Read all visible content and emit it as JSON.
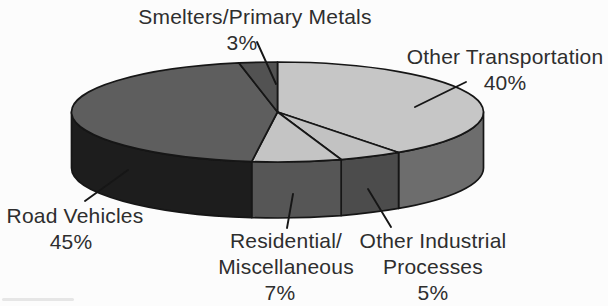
{
  "chart_data": {
    "type": "pie",
    "style": "3d-grayscale",
    "title": "",
    "start_position": "12-o-clock",
    "direction": "clockwise",
    "legend_position": "none",
    "categories": [
      "Other Transportation",
      "Other Industrial Processes",
      "Residential/Miscellaneous",
      "Road Vehicles",
      "Smelters/Primary Metals"
    ],
    "values": [
      40,
      5,
      7,
      45,
      3
    ],
    "slices": [
      {
        "id": "other-transportation",
        "name": "Other Transportation",
        "value": 40,
        "label_lines": [
          "Other Transportation"
        ],
        "pct_label": "40%",
        "top_color": "#c6c6c6",
        "side_color": "#6d6d6d"
      },
      {
        "id": "other-industrial-processes",
        "name": "Other Industrial Processes",
        "value": 5,
        "label_lines": [
          "Other Industrial",
          "Processes"
        ],
        "pct_label": "5%",
        "top_color": "#c2c2c2",
        "side_color": "#4c4c4c"
      },
      {
        "id": "residential-miscellaneous",
        "name": "Residential/Miscellaneous",
        "value": 7,
        "label_lines": [
          "Residential/",
          "Miscellaneous"
        ],
        "pct_label": "7%",
        "top_color": "#c4c4c4",
        "side_color": "#565656"
      },
      {
        "id": "road-vehicles",
        "name": "Road Vehicles",
        "value": 45,
        "label_lines": [
          "Road Vehicles"
        ],
        "pct_label": "45%",
        "top_color": "#5e5e5e",
        "side_color": "#1d1d1d"
      },
      {
        "id": "smelters-primary-metals",
        "name": "Smelters/Primary Metals",
        "value": 3,
        "label_lines": [
          "Smelters/Primary Metals"
        ],
        "pct_label": "3%",
        "top_color": "#525252",
        "side_color": "#3a3a3a"
      }
    ]
  }
}
